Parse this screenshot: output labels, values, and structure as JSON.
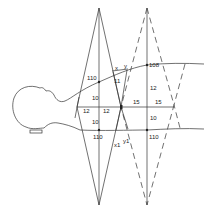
{
  "diagram": {
    "labels": {
      "top_left_ssd": "110",
      "top_right_ssd": "108",
      "bottom_left_ssd": "110",
      "bottom_right_ssd": "110",
      "upper_left_depth": "10",
      "lower_left_depth": "10",
      "left_half_width_a": "12",
      "left_half_width_b": "12",
      "right_half_width_a": "15",
      "right_half_width_b": "15",
      "upper_right_depth": "12",
      "lower_right_depth": "10",
      "gap_top_label": "11",
      "x_label": "x",
      "y_label": "y",
      "x1_label": "x1",
      "y1_label": "y1"
    }
  }
}
